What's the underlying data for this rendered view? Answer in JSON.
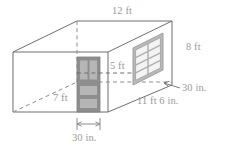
{
  "figure": {
    "kind": "isometric-room-diagram",
    "colors": {
      "outline": "#6f6f6f",
      "hidden_edge": "#8d8d8d",
      "label_text": "#9a9a9a",
      "door_frame": "#8c8c8c",
      "door_panel": "#b3b3b3",
      "window_frame": "#b9b9b9",
      "window_pane": "#f2f2f2",
      "background": "#ffffff"
    }
  },
  "labels": {
    "top_width": "12 ft",
    "right_height": "8 ft",
    "window_height": "5 ft",
    "depth": "7 ft",
    "window_sill_callout": "30 in.",
    "right_wall_length": "11 ft 6 in.",
    "door_width": "30 in."
  },
  "elements": {
    "door_name": "door",
    "window_name": "window",
    "dimension_line_name": "door-width-dimension-line"
  }
}
